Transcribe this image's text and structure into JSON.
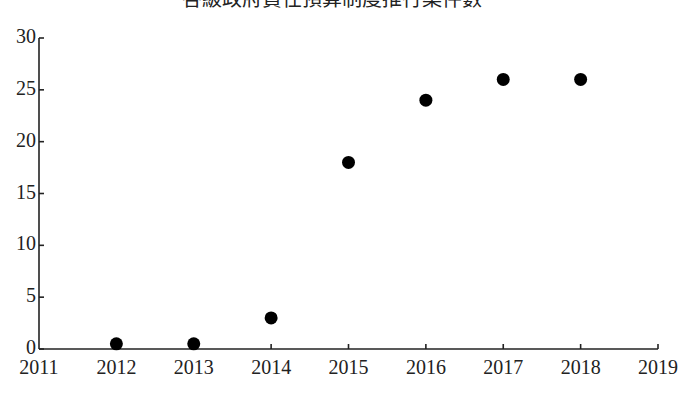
{
  "chart_data": {
    "type": "scatter",
    "title": "各級政府責任預算制度推行案件數",
    "xlabel": "",
    "ylabel": "",
    "xlim": [
      2011,
      2019
    ],
    "ylim": [
      0,
      30
    ],
    "x_ticks": [
      2011,
      2012,
      2013,
      2014,
      2015,
      2016,
      2017,
      2018,
      2019
    ],
    "x_tick_labels": [
      "2011",
      "2012",
      "2013",
      "2014",
      "2015",
      "2016",
      "2017",
      "2018",
      "2019"
    ],
    "y_ticks": [
      0,
      5,
      10,
      15,
      20,
      25,
      30
    ],
    "y_tick_labels": [
      "0",
      "5",
      "10",
      "15",
      "20",
      "25",
      "30"
    ],
    "grid": false,
    "legend": "none",
    "series": [
      {
        "name": "案件數",
        "color": "#000000",
        "x": [
          2012,
          2013,
          2014,
          2015,
          2016,
          2017,
          2018
        ],
        "y": [
          0.5,
          0.5,
          3,
          18,
          24,
          26,
          26
        ]
      }
    ]
  }
}
